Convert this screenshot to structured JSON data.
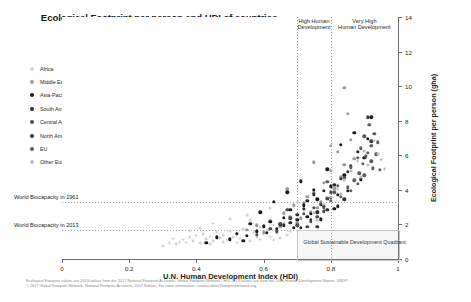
{
  "chart_data": {
    "type": "scatter",
    "title": "Ecological Footprint per person and HDI of countries by world regions (2013)",
    "title_line1": "Ecological Footprint per person and HDI of countries",
    "title_line2": "by world regions (2013)",
    "xlabel": "U.N. Human Development Index (HDI)",
    "ylabel": "Ecological Footprint per person (gha)",
    "xlim": [
      0,
      1
    ],
    "ylim": [
      0,
      14
    ],
    "xticks": [
      0,
      0.2,
      0.4,
      0.6,
      0.8,
      1
    ],
    "xtick_labels": [
      "0",
      "0.2",
      "0.4",
      "0.6",
      "0.8",
      "1"
    ],
    "yticks": [
      0,
      2,
      4,
      6,
      8,
      10,
      12,
      14
    ],
    "ytick_labels": [
      "0",
      "2",
      "4",
      "6",
      "8",
      "10",
      "12",
      "14"
    ],
    "grid": false,
    "legend_position": "upper-left-outside",
    "series": [
      {
        "name": "Africa",
        "color": "#d4d4d4",
        "points": [
          [
            0.34,
            0.84
          ],
          [
            0.35,
            1.0
          ],
          [
            0.36,
            1.12
          ],
          [
            0.37,
            0.95
          ],
          [
            0.38,
            1.25
          ],
          [
            0.39,
            1.05
          ],
          [
            0.4,
            1.35
          ],
          [
            0.41,
            0.92
          ],
          [
            0.42,
            1.45
          ],
          [
            0.43,
            1.15
          ],
          [
            0.44,
            1.3
          ],
          [
            0.45,
            1.02
          ],
          [
            0.46,
            1.55
          ],
          [
            0.47,
            1.22
          ],
          [
            0.48,
            1.4
          ],
          [
            0.49,
            1.08
          ],
          [
            0.5,
            1.62
          ],
          [
            0.51,
            1.28
          ],
          [
            0.52,
            1.48
          ],
          [
            0.53,
            1.18
          ],
          [
            0.54,
            1.72
          ],
          [
            0.55,
            1.35
          ],
          [
            0.56,
            1.05
          ],
          [
            0.57,
            1.55
          ],
          [
            0.58,
            1.25
          ],
          [
            0.59,
            1.85
          ],
          [
            0.6,
            1.42
          ],
          [
            0.61,
            1.65
          ],
          [
            0.62,
            1.3
          ],
          [
            0.63,
            1.95
          ],
          [
            0.64,
            1.5
          ],
          [
            0.65,
            1.2
          ],
          [
            0.66,
            2.1
          ],
          [
            0.68,
            1.6
          ],
          [
            0.7,
            3.3
          ],
          [
            0.72,
            2.8
          ],
          [
            0.3,
            0.75
          ],
          [
            0.32,
            0.9
          ],
          [
            0.33,
            1.18
          ],
          [
            0.45,
            2.05
          ],
          [
            0.5,
            2.3
          ],
          [
            0.55,
            2.55
          ],
          [
            0.62,
            2.95
          ],
          [
            0.67,
            1.38
          ],
          [
            0.41,
            1.78
          ],
          [
            0.38,
            1.62
          ],
          [
            0.44,
            0.88
          ],
          [
            0.48,
            0.98
          ],
          [
            0.52,
            0.95
          ],
          [
            0.56,
            2.25
          ],
          [
            0.59,
            1.12
          ],
          [
            0.63,
            1.08
          ]
        ]
      },
      {
        "name": "Middle East/Central Asia",
        "color": "#9b9b9b",
        "points": [
          [
            0.65,
            1.85
          ],
          [
            0.68,
            2.45
          ],
          [
            0.7,
            2.1
          ],
          [
            0.72,
            3.25
          ],
          [
            0.74,
            2.7
          ],
          [
            0.75,
            3.85
          ],
          [
            0.76,
            2.95
          ],
          [
            0.78,
            4.4
          ],
          [
            0.79,
            3.55
          ],
          [
            0.8,
            5.1
          ],
          [
            0.81,
            4.1
          ],
          [
            0.82,
            6.2
          ],
          [
            0.83,
            4.75
          ],
          [
            0.84,
            5.45
          ],
          [
            0.85,
            8.4
          ],
          [
            0.86,
            6.9
          ],
          [
            0.87,
            5.8
          ],
          [
            0.6,
            1.55
          ],
          [
            0.62,
            2.2
          ],
          [
            0.66,
            2.65
          ],
          [
            0.69,
            3.1
          ],
          [
            0.71,
            2.35
          ],
          [
            0.73,
            3.6
          ],
          [
            0.77,
            3.3
          ],
          [
            0.84,
            9.9
          ],
          [
            0.8,
            6.55
          ],
          [
            0.55,
            1.7
          ],
          [
            0.58,
            1.95
          ],
          [
            0.67,
            4.05
          ],
          [
            0.75,
            5.6
          ]
        ]
      },
      {
        "name": "Asia-Pacific",
        "color": "#1a1a1a",
        "points": [
          [
            0.55,
            1.35
          ],
          [
            0.58,
            1.6
          ],
          [
            0.6,
            1.9
          ],
          [
            0.62,
            2.15
          ],
          [
            0.64,
            1.75
          ],
          [
            0.66,
            2.4
          ],
          [
            0.68,
            2.85
          ],
          [
            0.7,
            2.25
          ],
          [
            0.72,
            3.1
          ],
          [
            0.74,
            2.6
          ],
          [
            0.76,
            3.45
          ],
          [
            0.78,
            3.05
          ],
          [
            0.8,
            4.2
          ],
          [
            0.82,
            3.7
          ],
          [
            0.84,
            4.85
          ],
          [
            0.86,
            5.4
          ],
          [
            0.88,
            6.2
          ],
          [
            0.9,
            5.85
          ],
          [
            0.91,
            6.95
          ],
          [
            0.5,
            1.15
          ],
          [
            0.52,
            1.45
          ],
          [
            0.54,
            1.05
          ],
          [
            0.56,
            2.05
          ],
          [
            0.59,
            2.7
          ],
          [
            0.61,
            1.5
          ],
          [
            0.63,
            3.3
          ],
          [
            0.65,
            2.0
          ],
          [
            0.67,
            3.85
          ],
          [
            0.69,
            1.8
          ],
          [
            0.71,
            4.5
          ],
          [
            0.73,
            2.45
          ],
          [
            0.75,
            4.0
          ],
          [
            0.77,
            2.3
          ],
          [
            0.79,
            5.2
          ],
          [
            0.81,
            2.9
          ],
          [
            0.83,
            6.6
          ],
          [
            0.85,
            3.95
          ],
          [
            0.87,
            7.3
          ],
          [
            0.89,
            4.6
          ],
          [
            0.92,
            8.2
          ],
          [
            0.43,
            0.95
          ],
          [
            0.46,
            1.25
          ]
        ]
      },
      {
        "name": "South America",
        "color": "#2b2b2b",
        "points": [
          [
            0.66,
            1.95
          ],
          [
            0.7,
            2.55
          ],
          [
            0.72,
            2.9
          ],
          [
            0.73,
            3.35
          ],
          [
            0.74,
            2.25
          ],
          [
            0.75,
            3.75
          ],
          [
            0.76,
            2.7
          ],
          [
            0.77,
            3.15
          ],
          [
            0.78,
            3.95
          ],
          [
            0.79,
            2.85
          ],
          [
            0.8,
            3.55
          ],
          [
            0.81,
            4.3
          ],
          [
            0.82,
            3.05
          ],
          [
            0.83,
            4.65
          ],
          [
            0.84,
            3.45
          ],
          [
            0.68,
            2.1
          ],
          [
            0.71,
            1.8
          ],
          [
            0.85,
            5.05
          ]
        ]
      },
      {
        "name": "Central America/Caribbean",
        "color": "#4d4d4d",
        "points": [
          [
            0.58,
            1.4
          ],
          [
            0.62,
            1.75
          ],
          [
            0.65,
            2.05
          ],
          [
            0.68,
            2.35
          ],
          [
            0.7,
            1.95
          ],
          [
            0.72,
            2.6
          ],
          [
            0.74,
            2.15
          ],
          [
            0.75,
            2.95
          ],
          [
            0.76,
            2.45
          ],
          [
            0.77,
            3.2
          ],
          [
            0.78,
            2.75
          ],
          [
            0.79,
            3.5
          ],
          [
            0.64,
            1.6
          ],
          [
            0.67,
            2.85
          ],
          [
            0.73,
            1.85
          ],
          [
            0.8,
            3.85
          ]
        ]
      },
      {
        "name": "North America",
        "color": "#3a3a3a",
        "points": [
          [
            0.91,
            8.2
          ],
          [
            0.92,
            6.8
          ],
          [
            0.76,
            1.85
          ]
        ]
      },
      {
        "name": "EU",
        "color": "#5e5e5e",
        "points": [
          [
            0.8,
            3.35
          ],
          [
            0.81,
            3.85
          ],
          [
            0.82,
            4.25
          ],
          [
            0.83,
            3.6
          ],
          [
            0.84,
            4.7
          ],
          [
            0.85,
            4.15
          ],
          [
            0.86,
            5.3
          ],
          [
            0.87,
            4.55
          ],
          [
            0.88,
            5.85
          ],
          [
            0.885,
            4.95
          ],
          [
            0.89,
            6.4
          ],
          [
            0.895,
            5.5
          ],
          [
            0.9,
            7.1
          ],
          [
            0.905,
            5.95
          ],
          [
            0.91,
            6.15
          ],
          [
            0.915,
            7.75
          ],
          [
            0.92,
            6.55
          ],
          [
            0.925,
            5.25
          ],
          [
            0.93,
            7.25
          ],
          [
            0.935,
            6.05
          ],
          [
            0.78,
            2.95
          ],
          [
            0.79,
            4.45
          ],
          [
            0.86,
            3.95
          ],
          [
            0.88,
            4.35
          ],
          [
            0.9,
            4.85
          ],
          [
            0.92,
            5.65
          ],
          [
            0.94,
            6.75
          ],
          [
            0.945,
            5.15
          ]
        ]
      },
      {
        "name": "Other Europe",
        "color": "#bdbdbd",
        "points": [
          [
            0.75,
            2.65
          ],
          [
            0.78,
            3.15
          ],
          [
            0.8,
            3.55
          ],
          [
            0.82,
            4.05
          ],
          [
            0.84,
            4.55
          ],
          [
            0.86,
            5.1
          ],
          [
            0.88,
            5.65
          ],
          [
            0.9,
            6.25
          ],
          [
            0.91,
            5.45
          ],
          [
            0.93,
            6.85
          ],
          [
            0.94,
            6.05
          ],
          [
            0.95,
            5.75
          ],
          [
            0.96,
            5.2
          ],
          [
            0.76,
            2.25
          ],
          [
            0.83,
            3.75
          ],
          [
            0.89,
            4.75
          ]
        ]
      }
    ],
    "reference_lines": [
      {
        "name": "World Biocapacity in 1961",
        "value": 3.3,
        "orientation": "horizontal"
      },
      {
        "name": "World Biocapacity in 2013",
        "value": 1.7,
        "orientation": "horizontal"
      }
    ],
    "development_bands": [
      {
        "label_line1": "High Human",
        "label_line2": "Development",
        "x_start": 0.7,
        "x_end": 0.8
      },
      {
        "label_line1": "Very High",
        "label_line2": "Human Development",
        "x_start": 0.8,
        "x_end": 1.0
      }
    ],
    "quadrant": {
      "label": "Global Sustainable Development Quadrant",
      "x_start": 0.7,
      "x_end": 1.0,
      "y_start": 0,
      "y_end": 1.7
    },
    "footnote_line1": "Ecological Footprint values are 2013 values from the 2017 National Footprint Accounts, Global Footprint Network  |  HDI 2013 values are from the 2016 Human Development Report, UNDP",
    "footnote_line2": "© 2017 Global Footprint Network, National Footprint Accounts, 2017 Edition. For more information: contact data@footprintnetwork.org"
  }
}
